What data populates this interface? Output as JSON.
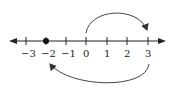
{
  "number_line": {
    "min": -3,
    "max": 3,
    "tick_labels": [
      "−3",
      "−2",
      "−1",
      "0",
      "1",
      "2",
      "3"
    ],
    "point": -2,
    "colors": {
      "line": "#222222",
      "point": "#111111",
      "arrow": "#444444"
    }
  },
  "arcs": [
    {
      "from": 0,
      "to": 3,
      "side": "above"
    },
    {
      "from": 3,
      "to": -2,
      "side": "below"
    }
  ]
}
